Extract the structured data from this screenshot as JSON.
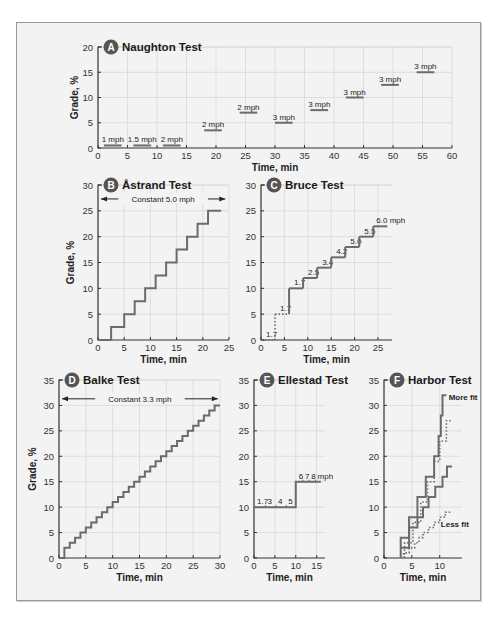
{
  "colors": {
    "panel_bg": "#f3f3f3",
    "panel_border": "#9a9a9a",
    "badge_bg": "#555555",
    "step_line": "#6b6b6b",
    "grid": "#d8d8d8"
  },
  "chart_data": [
    {
      "id": "A",
      "type": "line",
      "title": "Naughton Test",
      "badge": "A",
      "xlabel": "Time, min",
      "ylabel": "Grade, %",
      "xlim": [
        0,
        60
      ],
      "ylim": [
        0,
        20
      ],
      "xticks": [
        0,
        5,
        10,
        15,
        20,
        25,
        30,
        35,
        40,
        45,
        50,
        55,
        60
      ],
      "yticks": [
        0,
        5,
        10,
        15,
        20
      ],
      "grid": true,
      "stages": [
        {
          "x_start": 1,
          "x_end": 4,
          "grade": 0.5,
          "label": "1 mph"
        },
        {
          "x_start": 6,
          "x_end": 9,
          "grade": 0.5,
          "label": "1.5 mph"
        },
        {
          "x_start": 11,
          "x_end": 14,
          "grade": 0.5,
          "label": "2 mph"
        },
        {
          "x_start": 18,
          "x_end": 21,
          "grade": 3.5,
          "label": "2 mph"
        },
        {
          "x_start": 24,
          "x_end": 27,
          "grade": 7,
          "label": "2 mph"
        },
        {
          "x_start": 30,
          "x_end": 33,
          "grade": 5,
          "label": "3 mph"
        },
        {
          "x_start": 36,
          "x_end": 39,
          "grade": 7.5,
          "label": "3 mph"
        },
        {
          "x_start": 42,
          "x_end": 45,
          "grade": 10,
          "label": "3 mph"
        },
        {
          "x_start": 48,
          "x_end": 51,
          "grade": 12.5,
          "label": "3 mph"
        },
        {
          "x_start": 54,
          "x_end": 57,
          "grade": 15,
          "label": "3 mph"
        }
      ]
    },
    {
      "id": "B",
      "type": "line",
      "title": "Åstrand Test",
      "badge": "B",
      "xlabel": "Time, min",
      "ylabel": "Grade, %",
      "xlim": [
        0,
        25
      ],
      "ylim": [
        0,
        30
      ],
      "xticks": [
        0,
        5,
        10,
        15,
        20,
        25
      ],
      "yticks": [
        0,
        5,
        10,
        15,
        20,
        25,
        30
      ],
      "grid": true,
      "annotation": "Constant 5.0 mph",
      "x": [
        0,
        2.5,
        2.5,
        5,
        5,
        7,
        7,
        9,
        9,
        11,
        11,
        13,
        13,
        15,
        15,
        17,
        17,
        19,
        19,
        21,
        21,
        23.5
      ],
      "y": [
        0,
        0,
        2.5,
        2.5,
        5,
        5,
        7.5,
        7.5,
        10,
        10,
        12.5,
        12.5,
        15,
        15,
        17.5,
        17.5,
        20,
        20,
        22.5,
        22.5,
        25,
        25
      ]
    },
    {
      "id": "C",
      "type": "line",
      "title": "Bruce Test",
      "badge": "C",
      "xlabel": "Time, min",
      "ylabel": "",
      "xlim": [
        0,
        28
      ],
      "ylim": [
        0,
        30
      ],
      "xticks": [
        0,
        5,
        10,
        15,
        20,
        25
      ],
      "yticks": [
        0,
        5,
        10,
        15,
        20,
        25,
        30
      ],
      "grid": true,
      "stages": [
        {
          "x_start": 0,
          "x_end": 3,
          "grade": 0,
          "speed": "1.7",
          "style": "dotted"
        },
        {
          "x_start": 3,
          "x_end": 6,
          "grade": 5,
          "speed": "1.7",
          "style": "dotted"
        },
        {
          "x_start": 6,
          "x_end": 9,
          "grade": 10,
          "speed": "1.7",
          "style": "solid"
        },
        {
          "x_start": 9,
          "x_end": 12,
          "grade": 12,
          "speed": "2.5",
          "style": "solid"
        },
        {
          "x_start": 12,
          "x_end": 15,
          "grade": 14,
          "speed": "3.4",
          "style": "solid"
        },
        {
          "x_start": 15,
          "x_end": 18,
          "grade": 16,
          "speed": "4.2",
          "style": "solid"
        },
        {
          "x_start": 18,
          "x_end": 21,
          "grade": 18,
          "speed": "5.0",
          "style": "solid"
        },
        {
          "x_start": 21,
          "x_end": 24,
          "grade": 20,
          "speed": "5.5",
          "style": "solid"
        },
        {
          "x_start": 24,
          "x_end": 27,
          "grade": 22,
          "speed": "6.0 mph",
          "style": "solid"
        }
      ]
    },
    {
      "id": "D",
      "type": "line",
      "title": "Balke Test",
      "badge": "D",
      "xlabel": "Time, min",
      "ylabel": "Grade, %",
      "xlim": [
        0,
        30
      ],
      "ylim": [
        0,
        35
      ],
      "xticks": [
        0,
        5,
        10,
        15,
        20,
        25,
        30
      ],
      "yticks": [
        0,
        5,
        10,
        15,
        20,
        25,
        30,
        35
      ],
      "grid": true,
      "annotation": "Constant 3.3 mph",
      "step_rule": "0% for first minute, then +1% grade each minute",
      "x_steps": [
        0,
        1,
        2,
        3,
        4,
        5,
        6,
        7,
        8,
        9,
        10,
        11,
        12,
        13,
        14,
        15,
        16,
        17,
        18,
        19,
        20,
        21,
        22,
        23,
        24,
        25,
        26,
        27,
        28,
        29,
        30
      ],
      "y_steps": [
        0,
        2,
        3,
        4,
        5,
        6,
        7,
        8,
        9,
        10,
        11,
        12,
        13,
        14,
        15,
        16,
        17,
        18,
        19,
        20,
        21,
        22,
        23,
        24,
        25,
        26,
        27,
        28,
        29,
        30,
        30
      ]
    },
    {
      "id": "E",
      "type": "line",
      "title": "Ellestad Test",
      "badge": "E",
      "xlabel": "Time, min",
      "ylabel": "",
      "xlim": [
        0,
        17
      ],
      "ylim": [
        0,
        35
      ],
      "xticks": [
        0,
        5,
        10,
        15
      ],
      "yticks": [
        0,
        5,
        10,
        15,
        20,
        25,
        30,
        35
      ],
      "grid": true,
      "stages": [
        {
          "x_start": 0,
          "x_end": 10,
          "grade": 10,
          "speed_labels": [
            "1.7",
            "3",
            "4",
            "5"
          ]
        },
        {
          "x_start": 10,
          "x_end": 16,
          "grade": 15,
          "speed_labels": [
            "6",
            "7",
            "8",
            "mph"
          ]
        }
      ]
    },
    {
      "id": "F",
      "type": "line",
      "title": "Harbor Test",
      "badge": "F",
      "xlabel": "Time, min",
      "ylabel": "",
      "xlim": [
        0,
        14
      ],
      "ylim": [
        0,
        35
      ],
      "xticks": [
        0,
        5,
        10
      ],
      "yticks": [
        0,
        5,
        10,
        15,
        20,
        25,
        30,
        35
      ],
      "grid": true,
      "annotations": [
        "More fit",
        "Less fit"
      ],
      "series": [
        {
          "name": "More fit",
          "style": "solid",
          "x": [
            3,
            3,
            4.5,
            4.5,
            6,
            6,
            7.5,
            7.5,
            9,
            9,
            10.5,
            10.5
          ],
          "y": [
            0,
            4,
            4,
            8,
            8,
            12,
            12,
            16,
            16,
            20,
            20,
            24,
            24,
            28,
            28,
            32
          ]
        },
        {
          "name": "Intermediate 1",
          "style": "dotted",
          "x": [
            3.5,
            5,
            6.5,
            8,
            9.5,
            11,
            12
          ],
          "y": [
            3,
            7,
            11,
            15,
            19,
            23,
            27
          ]
        },
        {
          "name": "Intermediate 2",
          "style": "solid",
          "x": [
            3,
            5,
            7,
            8.5,
            10,
            11,
            12
          ],
          "y": [
            2,
            6,
            10,
            12,
            14,
            16,
            18
          ]
        },
        {
          "name": "Less fit",
          "style": "dotted",
          "x": [
            3.5,
            5,
            6,
            7,
            8,
            9,
            10,
            11,
            12
          ],
          "y": [
            1,
            2,
            3,
            4,
            5,
            6,
            7,
            8,
            9
          ]
        }
      ]
    }
  ]
}
